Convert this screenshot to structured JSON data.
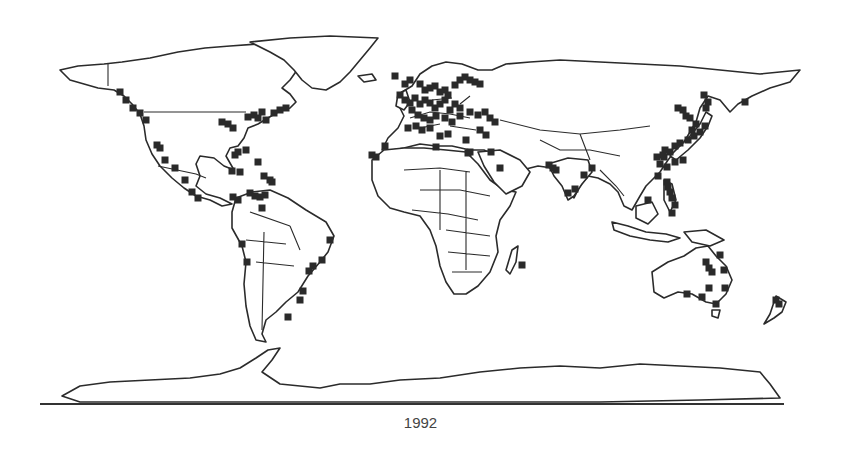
{
  "map": {
    "title": "World map of station locations",
    "caption": "1992",
    "projection": "equirectangular",
    "marker_shape": "filled-square",
    "marker_color": "#2a2a2a",
    "outline_color": "#2b2b2b",
    "background": "#ffffff",
    "markers": [
      [
        120,
        92
      ],
      [
        126,
        100
      ],
      [
        133,
        108
      ],
      [
        140,
        113
      ],
      [
        146,
        120
      ],
      [
        157,
        145
      ],
      [
        160,
        148
      ],
      [
        165,
        160
      ],
      [
        175,
        168
      ],
      [
        185,
        180
      ],
      [
        192,
        192
      ],
      [
        198,
        198
      ],
      [
        222,
        122
      ],
      [
        228,
        124
      ],
      [
        233,
        128
      ],
      [
        248,
        117
      ],
      [
        254,
        115
      ],
      [
        258,
        118
      ],
      [
        262,
        112
      ],
      [
        266,
        120
      ],
      [
        274,
        113
      ],
      [
        280,
        110
      ],
      [
        286,
        108
      ],
      [
        246,
        150
      ],
      [
        238,
        152
      ],
      [
        235,
        155
      ],
      [
        232,
        171
      ],
      [
        240,
        172
      ],
      [
        258,
        162
      ],
      [
        264,
        176
      ],
      [
        270,
        180
      ],
      [
        272,
        182
      ],
      [
        233,
        197
      ],
      [
        238,
        200
      ],
      [
        250,
        193
      ],
      [
        255,
        196
      ],
      [
        260,
        197
      ],
      [
        265,
        195
      ],
      [
        262,
        208
      ],
      [
        242,
        244
      ],
      [
        247,
        262
      ],
      [
        330,
        240
      ],
      [
        322,
        260
      ],
      [
        313,
        266
      ],
      [
        309,
        271
      ],
      [
        303,
        291
      ],
      [
        300,
        300
      ],
      [
        288,
        317
      ],
      [
        395,
        76
      ],
      [
        405,
        84
      ],
      [
        410,
        80
      ],
      [
        420,
        84
      ],
      [
        425,
        90
      ],
      [
        430,
        88
      ],
      [
        435,
        86
      ],
      [
        440,
        92
      ],
      [
        445,
        90
      ],
      [
        448,
        95
      ],
      [
        455,
        85
      ],
      [
        460,
        80
      ],
      [
        465,
        77
      ],
      [
        470,
        80
      ],
      [
        475,
        82
      ],
      [
        480,
        84
      ],
      [
        400,
        95
      ],
      [
        405,
        100
      ],
      [
        410,
        103
      ],
      [
        415,
        98
      ],
      [
        420,
        104
      ],
      [
        425,
        100
      ],
      [
        430,
        103
      ],
      [
        435,
        108
      ],
      [
        440,
        104
      ],
      [
        445,
        100
      ],
      [
        450,
        110
      ],
      [
        455,
        104
      ],
      [
        460,
        108
      ],
      [
        412,
        110
      ],
      [
        418,
        115
      ],
      [
        424,
        118
      ],
      [
        430,
        120
      ],
      [
        436,
        116
      ],
      [
        445,
        118
      ],
      [
        452,
        122
      ],
      [
        460,
        116
      ],
      [
        470,
        112
      ],
      [
        478,
        115
      ],
      [
        485,
        112
      ],
      [
        490,
        118
      ],
      [
        495,
        122
      ],
      [
        408,
        128
      ],
      [
        416,
        126
      ],
      [
        422,
        130
      ],
      [
        430,
        128
      ],
      [
        440,
        136
      ],
      [
        448,
        134
      ],
      [
        466,
        140
      ],
      [
        470,
        152
      ],
      [
        480,
        130
      ],
      [
        486,
        135
      ],
      [
        372,
        155
      ],
      [
        376,
        157
      ],
      [
        385,
        146
      ],
      [
        436,
        147
      ],
      [
        468,
        153
      ],
      [
        491,
        152
      ],
      [
        500,
        168
      ],
      [
        522,
        265
      ],
      [
        549,
        165
      ],
      [
        553,
        168
      ],
      [
        556,
        170
      ],
      [
        568,
        193
      ],
      [
        575,
        189
      ],
      [
        584,
        175
      ],
      [
        592,
        168
      ],
      [
        667,
        182
      ],
      [
        668,
        187
      ],
      [
        670,
        192
      ],
      [
        672,
        198
      ],
      [
        675,
        205
      ],
      [
        672,
        213
      ],
      [
        648,
        200
      ],
      [
        658,
        176
      ],
      [
        665,
        150
      ],
      [
        664,
        157
      ],
      [
        670,
        152
      ],
      [
        675,
        146
      ],
      [
        680,
        143
      ],
      [
        688,
        140
      ],
      [
        694,
        136
      ],
      [
        700,
        132
      ],
      [
        705,
        126
      ],
      [
        692,
        130
      ],
      [
        696,
        124
      ],
      [
        690,
        118
      ],
      [
        686,
        116
      ],
      [
        683,
        110
      ],
      [
        678,
        108
      ],
      [
        706,
        108
      ],
      [
        708,
        102
      ],
      [
        704,
        95
      ],
      [
        745,
        102
      ],
      [
        663,
        155
      ],
      [
        657,
        157
      ],
      [
        660,
        164
      ],
      [
        667,
        167
      ],
      [
        675,
        162
      ],
      [
        683,
        160
      ],
      [
        706,
        262
      ],
      [
        709,
        268
      ],
      [
        712,
        272
      ],
      [
        709,
        288
      ],
      [
        702,
        297
      ],
      [
        687,
        294
      ],
      [
        716,
        304
      ],
      [
        725,
        288
      ],
      [
        724,
        270
      ],
      [
        720,
        255
      ],
      [
        776,
        300
      ],
      [
        779,
        304
      ]
    ]
  }
}
